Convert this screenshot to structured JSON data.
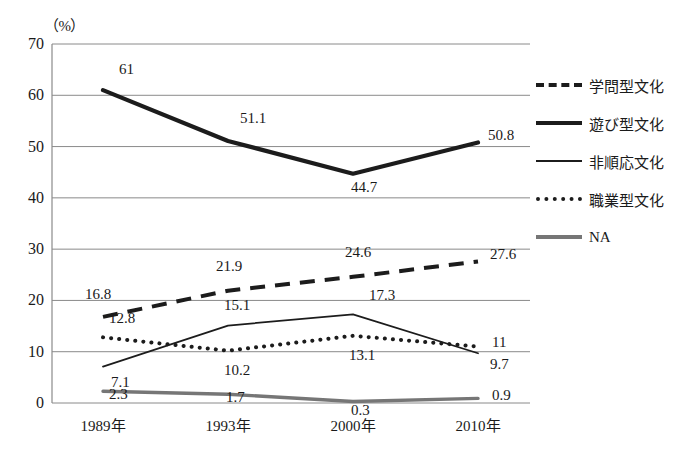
{
  "chart_data": {
    "type": "line",
    "title": "",
    "xlabel": "",
    "ylabel": "",
    "unit_label": "（%）",
    "categories": [
      "1989年",
      "1993年",
      "2000年",
      "2010年"
    ],
    "ylim": [
      0,
      70
    ],
    "yticks": [
      "70",
      "60",
      "50",
      "40",
      "30",
      "20",
      "10",
      "0"
    ],
    "grid": true,
    "legend_position": "right",
    "series": [
      {
        "name": "学問型文化",
        "style": "dashed",
        "color": "#1c1c1c",
        "values": [
          16.8,
          21.9,
          24.6,
          27.6
        ],
        "labels": [
          "16.8",
          "21.9",
          "24.6",
          "27.6"
        ]
      },
      {
        "name": "遊び型文化",
        "style": "thick-solid",
        "color": "#1c1c1c",
        "values": [
          61,
          51.1,
          44.7,
          50.8
        ],
        "labels": [
          "61",
          "51.1",
          "44.7",
          "50.8"
        ]
      },
      {
        "name": "非順応文化",
        "style": "thin-solid",
        "color": "#1c1c1c",
        "values": [
          7.1,
          15.1,
          17.3,
          9.7
        ],
        "labels": [
          "7.1",
          "15.1",
          "17.3",
          "9.7"
        ]
      },
      {
        "name": "職業型文化",
        "style": "dotted",
        "color": "#1c1c1c",
        "values": [
          12.8,
          10.2,
          13.1,
          11
        ],
        "labels": [
          "12.8",
          "10.2",
          "13.1",
          "11"
        ]
      },
      {
        "name": "NA",
        "style": "gray-solid",
        "color": "#767676",
        "values": [
          2.3,
          1.7,
          0.3,
          0.9
        ],
        "labels": [
          "2.3",
          "1.7",
          "0.3",
          "0.9"
        ]
      }
    ]
  },
  "legend": {
    "items": [
      {
        "label": "学問型文化",
        "key": "k-dashed"
      },
      {
        "label": "遊び型文化",
        "key": "k-thick"
      },
      {
        "label": "非順応文化",
        "key": "k-thin"
      },
      {
        "label": "職業型文化",
        "key": "k-dotted"
      },
      {
        "label": "NA",
        "key": "k-gray"
      }
    ]
  },
  "colors": {
    "axis": "#8a8a8a",
    "grid": "#8a8a8a",
    "ink": "#1c1c1c",
    "na": "#767676"
  }
}
